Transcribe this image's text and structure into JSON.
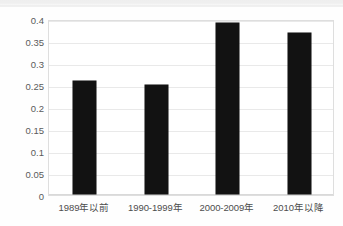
{
  "chart_data": {
    "type": "bar",
    "title": "",
    "subtitle": "",
    "xlabel": "",
    "ylabel": "",
    "categories": [
      "1989年以前",
      "1990-1999年",
      "2000-2009年",
      "2010年以降"
    ],
    "values": [
      0.257,
      0.248,
      0.389,
      0.365
    ],
    "series": [
      {
        "name": "",
        "values": [
          0.257,
          0.248,
          0.389,
          0.365
        ]
      }
    ],
    "ylim": [
      0,
      0.4
    ],
    "ytick_labels": [
      "0",
      "0.05",
      "0.1",
      "0.15",
      "0.2",
      "0.25",
      "0.3",
      "0.35",
      "0.4"
    ],
    "ytick_values": [
      0,
      0.05,
      0.1,
      0.15,
      0.2,
      0.25,
      0.3,
      0.35,
      0.4
    ],
    "grid": true,
    "legend": false,
    "legend_position": "none",
    "annotations": [],
    "colors": {
      "bar": "#121212",
      "gridline": "#e9e9e9",
      "frame": "#dedede",
      "tick_text": "#5a5a5a",
      "category_text": "#4d4d4d",
      "background": "#ffffff"
    }
  }
}
